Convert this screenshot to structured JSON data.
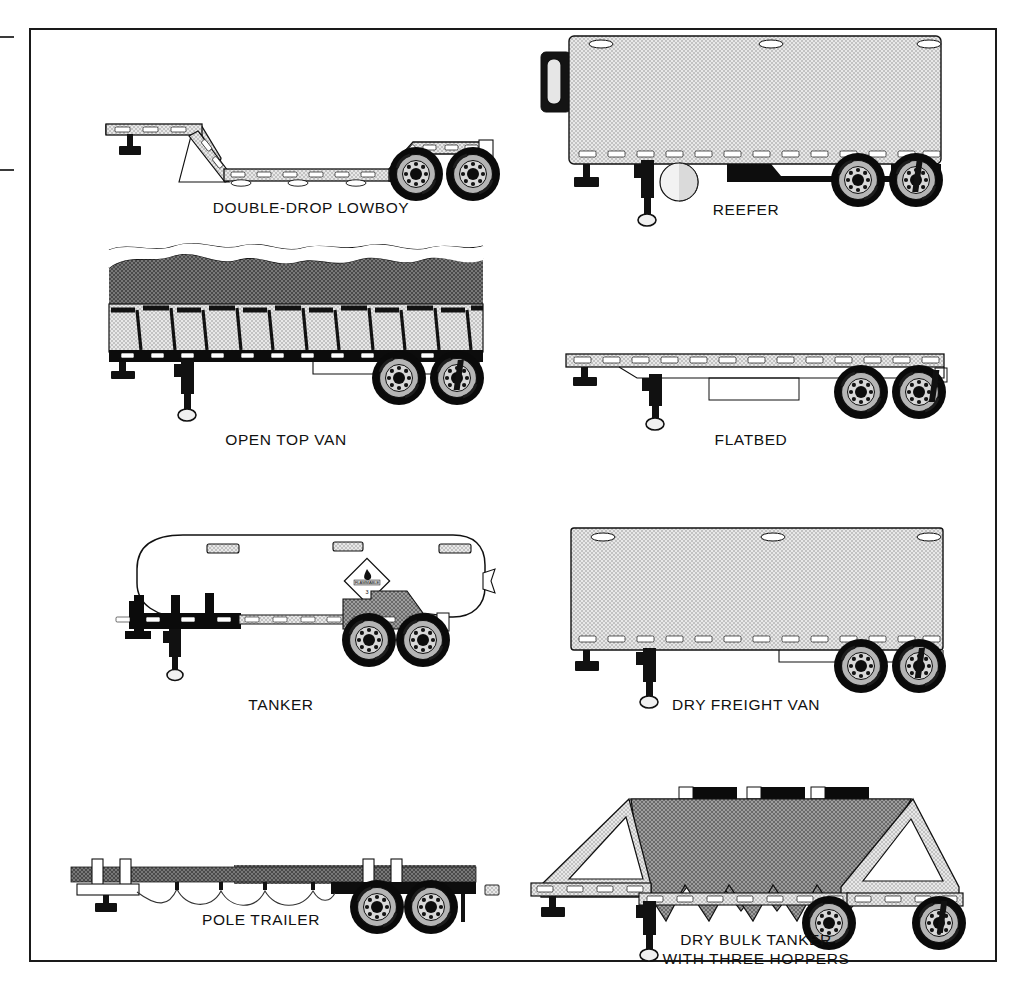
{
  "page": {
    "background_color": "#ffffff",
    "frame_color": "#1a1a1a"
  },
  "palette": {
    "outline": "#111111",
    "body_light_gray": "#d6d6d6",
    "body_mid_gray": "#bdbdbd",
    "load_dark_gray": "#6b6b6b",
    "beam_gray": "#5a5a5a",
    "black": "#000000",
    "white": "#ffffff",
    "rim_gray": "#9a9a9a"
  },
  "crop_marks": [
    {
      "name": "tick-top-left",
      "x": 0,
      "y": 36
    },
    {
      "name": "tick-mid-left",
      "x": 0,
      "y": 169
    }
  ],
  "figures": [
    {
      "id": "double-drop-lowboy",
      "label": "DOUBLE-DROP LOWBOY",
      "caption_lines": [
        "DOUBLE-DROP LOWBOY"
      ],
      "column": "left",
      "row": 1,
      "features": [
        "gooseneck",
        "drop deck",
        "landing gear",
        "tandem axle",
        "marker lights"
      ]
    },
    {
      "id": "reefer",
      "label": "REEFER",
      "caption_lines": [
        "REEFER"
      ],
      "column": "right",
      "row": 1,
      "features": [
        "refrigeration unit",
        "enclosed box",
        "roof vents",
        "landing gear",
        "tandem axle",
        "spare tire"
      ]
    },
    {
      "id": "open-top-van",
      "label": "OPEN TOP VAN",
      "caption_lines": [
        "OPEN TOP VAN"
      ],
      "column": "left",
      "row": 2,
      "features": [
        "open top",
        "tarp load",
        "side posts",
        "landing gear",
        "tandem axle"
      ]
    },
    {
      "id": "flatbed",
      "label": "FLATBED",
      "caption_lines": [
        "FLATBED"
      ],
      "column": "right",
      "row": 2,
      "features": [
        "flat deck",
        "landing gear",
        "tandem axle",
        "toolbox"
      ]
    },
    {
      "id": "tanker",
      "label": "TANKER",
      "caption_lines": [
        "TANKER"
      ],
      "column": "left",
      "row": 3,
      "features": [
        "cylindrical tank",
        "hazmat placard",
        "manhole covers",
        "landing gear",
        "tandem axle"
      ],
      "placard": {
        "name": "hazmat-placard",
        "shape": "diamond",
        "symbol": "flame",
        "text": "FLAMMABLE",
        "class_number": "3"
      }
    },
    {
      "id": "dry-freight-van",
      "label": "DRY FREIGHT VAN",
      "caption_lines": [
        "DRY FREIGHT VAN"
      ],
      "column": "right",
      "row": 3,
      "features": [
        "enclosed box",
        "roof vents",
        "landing gear",
        "tandem axle"
      ]
    },
    {
      "id": "pole-trailer",
      "label": "POLE TRAILER",
      "caption_lines": [
        "POLE TRAILER"
      ],
      "column": "left",
      "row": 4,
      "features": [
        "extendable pole beam",
        "bolsters",
        "air hose",
        "tandem axle"
      ]
    },
    {
      "id": "dry-bulk-tanker",
      "label": "DRY BULK TANKER WITH THREE HOPPERS",
      "caption_lines": [
        "DRY BULK TANKER",
        "WITH THREE HOPPERS"
      ],
      "column": "right",
      "row": 4,
      "features": [
        "three hopper cones",
        "top loading hatches",
        "A-frame supports",
        "landing gear",
        "tandem axle"
      ],
      "hopper_count": 3
    }
  ]
}
